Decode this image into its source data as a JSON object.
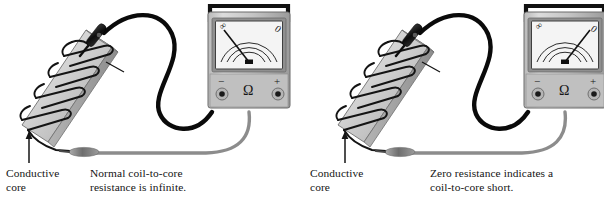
{
  "figure": {
    "panel_count": 2
  },
  "colors": {
    "background": "#ffffff",
    "core_light": "#e6e6e6",
    "core_mid": "#c9c9c9",
    "core_dark": "#9a9a9a",
    "core_edge": "#6f6f6f",
    "coil_wire": "#111111",
    "black_lead": "#0a0a0a",
    "gray_lead": "#8c8c8c",
    "meter_body_light": "#d2d2d2",
    "meter_body_dark": "#9d9d9d",
    "meter_face": "#f2f2f2",
    "meter_frame": "#7a7a7a",
    "handle": "#111111",
    "text": "#141414"
  },
  "panels": [
    {
      "id": "normal-coil",
      "core_label": "Conductive\ncore",
      "note": "Normal coil-to-core\nresistance is infinite.",
      "meter": {
        "scale_left_label": "∞",
        "scale_right_label": "0",
        "terminal_negative": "−",
        "terminal_function": "Ω",
        "terminal_positive": "+",
        "needle_reading": "infinite",
        "needle_angle_deg": -48,
        "arc_count": 3
      },
      "probes": {
        "black_probe_contact": "core",
        "gray_probe_contact": "coil-wire-end"
      }
    },
    {
      "id": "shorted-coil",
      "core_label": "Conductive\ncore",
      "note": "Zero resistance indicates a\ncoil-to-core short.",
      "meter": {
        "scale_left_label": "∞",
        "scale_right_label": "0",
        "terminal_negative": "−",
        "terminal_function": "Ω",
        "terminal_positive": "+",
        "needle_reading": "zero",
        "needle_angle_deg": 48,
        "arc_count": 3
      },
      "probes": {
        "black_probe_contact": "core",
        "gray_probe_contact": "coil-wire-end"
      }
    }
  ]
}
